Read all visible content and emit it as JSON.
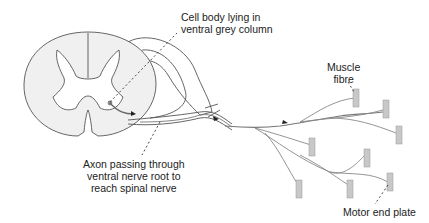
{
  "diagram": {
    "colors": {
      "background": "#ffffff",
      "cord_fill": "#f0f0f0",
      "outline": "#555555",
      "nerve": "#777777",
      "muscle_fibre": "#c8c8c8",
      "label_text": "#222222"
    },
    "labels": {
      "cell_body": [
        "Cell body lying in",
        "ventral grey column"
      ],
      "muscle_fibre": [
        "Muscle",
        "fibre"
      ],
      "axon": [
        "Axon passing through",
        "ventral nerve root to",
        "reach spinal nerve"
      ],
      "motor_end_plate": "Motor end plate"
    },
    "structures": {
      "spinal_cord": "spinal-cord-cross-section",
      "grey_matter": "butterfly-grey-matter",
      "ventral_root": "ventral-nerve-root",
      "spinal_nerve": "spinal-nerve",
      "cell_body": "motor-neuron-cell-body",
      "direction_arrows": 3,
      "muscle_fibre_count": 8
    }
  }
}
